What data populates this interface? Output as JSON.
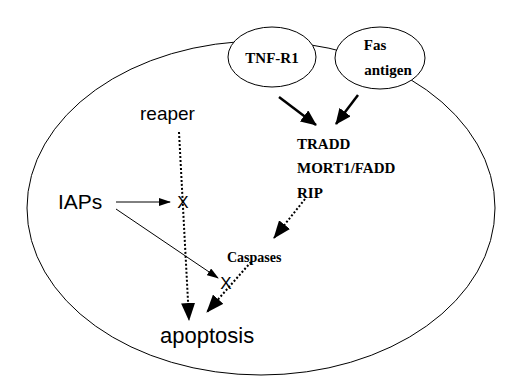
{
  "diagram": {
    "cell": {
      "label": ""
    },
    "receptors": [
      {
        "id": "tnf-r1",
        "label": "TNF-R1"
      },
      {
        "id": "fas",
        "label_line1": "Fas",
        "label_line2": "antigen"
      }
    ],
    "adaptors": [
      "TRADD",
      "MORT1/FADD",
      "RIP"
    ],
    "nodes": {
      "reaper": "reaper",
      "iaps": "IAPs",
      "caspases": "Caspases",
      "apoptosis": "apoptosis",
      "block_mark_1": "X",
      "block_mark_2": "X"
    },
    "edges": [
      {
        "from": "TNF-R1",
        "to": "TRADD/MORT1/FADD/RIP",
        "style": "solid-bold"
      },
      {
        "from": "Fas antigen",
        "to": "TRADD/MORT1/FADD/RIP",
        "style": "solid-bold"
      },
      {
        "from": "RIP",
        "to": "Caspases",
        "style": "dotted"
      },
      {
        "from": "Caspases",
        "to": "apoptosis",
        "style": "dotted",
        "blocked_by": "IAPs"
      },
      {
        "from": "reaper",
        "to": "apoptosis",
        "style": "dotted",
        "blocked_by": "IAPs"
      },
      {
        "from": "IAPs",
        "to": "block_mark_1",
        "style": "solid-thin"
      },
      {
        "from": "IAPs",
        "to": "block_mark_2",
        "style": "solid-thin"
      }
    ],
    "colors": {
      "stroke": "#000000",
      "background": "#ffffff"
    }
  }
}
